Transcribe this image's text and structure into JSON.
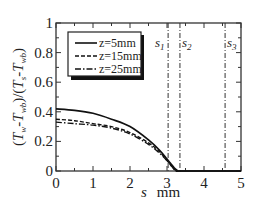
{
  "chart_data": {
    "type": "line",
    "title": "",
    "xlabel": "s   mm",
    "xlabel_var": "s",
    "xlabel_unit": "mm",
    "ylabel": "(T_w-T_wb)/(T_s-T_wb)",
    "xlim": [
      0,
      5
    ],
    "ylim": [
      0,
      1
    ],
    "xticks": [
      "0",
      "1",
      "2",
      "3",
      "4",
      "5"
    ],
    "yticks": [
      "0",
      "0.2",
      "0.4",
      "0.6",
      "0.8",
      "1"
    ],
    "grid": false,
    "legend_position": "upper left",
    "series": [
      {
        "name": "z=5mm",
        "style": "solid",
        "x": [
          0,
          0.5,
          1.0,
          1.5,
          2.0,
          2.5,
          2.8,
          3.0,
          3.1,
          3.2,
          3.3,
          3.4,
          5.0
        ],
        "y": [
          0.42,
          0.41,
          0.39,
          0.35,
          0.3,
          0.21,
          0.14,
          0.08,
          0.05,
          0.02,
          0.0,
          0.0,
          0.0
        ]
      },
      {
        "name": "z=15mm",
        "style": "dashed",
        "x": [
          0,
          0.5,
          1.0,
          1.5,
          2.0,
          2.5,
          2.8,
          3.0,
          3.1,
          3.2,
          3.3
        ],
        "y": [
          0.35,
          0.34,
          0.32,
          0.3,
          0.26,
          0.19,
          0.13,
          0.07,
          0.04,
          0.01,
          0.0
        ]
      },
      {
        "name": "z=25mm",
        "style": "dash-dot",
        "x": [
          0,
          0.5,
          1.0,
          1.5,
          2.0,
          2.5,
          2.8,
          3.0,
          3.1,
          3.2,
          3.3
        ],
        "y": [
          0.33,
          0.32,
          0.31,
          0.29,
          0.25,
          0.18,
          0.12,
          0.07,
          0.04,
          0.01,
          0.0
        ]
      }
    ],
    "vlines": [
      {
        "label": "s1",
        "x": 3.03,
        "style": "dash-dot"
      },
      {
        "label": "s2",
        "x": 3.35,
        "style": "dash-dot"
      },
      {
        "label": "s3",
        "x": 4.57,
        "style": "dash-dot"
      }
    ]
  },
  "legend": {
    "items": [
      {
        "label": "z=5mm",
        "style": "solid"
      },
      {
        "label": "z=15mm",
        "style": "dashed"
      },
      {
        "label": "z=25mm",
        "style": "dash-dot"
      }
    ]
  },
  "axes": {
    "x_var": "s",
    "x_unit": "mm",
    "y_label_parts": {
      "open": "(",
      "T1": "T",
      "sub1": "w",
      "minus1": "-",
      "T2": "T",
      "sub2": "wb",
      "mid": ")/(",
      "T3": "T",
      "sub3": "s",
      "minus2": "-",
      "T4": "T",
      "sub4": "wb",
      "close": ")"
    }
  },
  "markers": {
    "s1": {
      "base": "s",
      "sub": "1"
    },
    "s2": {
      "base": "s",
      "sub": "2"
    },
    "s3": {
      "base": "s",
      "sub": "3"
    }
  }
}
